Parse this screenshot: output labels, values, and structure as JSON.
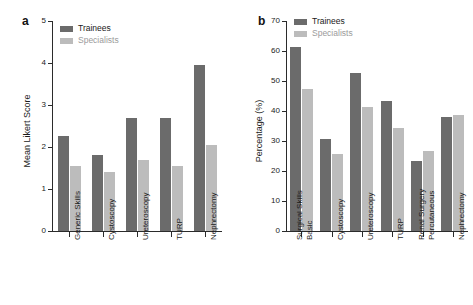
{
  "figure": {
    "background": "#ffffff",
    "colors": {
      "trainees": "#6b6b6b",
      "specialists": "#bcbcbc",
      "axis": "#2b2b2b",
      "text": "#1a1a1a"
    }
  },
  "panel_a": {
    "letter": "a",
    "legend": [
      {
        "label": "Trainees",
        "color": "#6b6b6b"
      },
      {
        "label": "Specialists",
        "color": "#bcbcbc"
      }
    ]
  },
  "panel_b": {
    "letter": "b",
    "legend": [
      {
        "label": "Trainees",
        "color": "#6b6b6b"
      },
      {
        "label": "Specialists",
        "color": "#bcbcbc"
      }
    ]
  },
  "chart_data": [
    {
      "panel": "a",
      "type": "bar",
      "title": "",
      "xlabel": "",
      "ylabel": "Mean Likert Score",
      "ylim": [
        0,
        5
      ],
      "yticks": [
        0,
        1,
        2,
        3,
        4,
        5
      ],
      "ytick_labels": [
        "0",
        "1",
        "2",
        "3",
        "4",
        "5"
      ],
      "grid": false,
      "legend_position": "top-left",
      "categories": [
        "Generic Skills",
        "Cystoscopy",
        "Ureteroscopy",
        "TURP",
        "Nephrectomy"
      ],
      "series": [
        {
          "name": "Trainees",
          "color": "#6b6b6b",
          "values": [
            2.27,
            1.81,
            2.68,
            2.68,
            3.95
          ]
        },
        {
          "name": "Specialists",
          "color": "#bcbcbc",
          "values": [
            1.55,
            1.4,
            1.7,
            1.55,
            2.05
          ]
        }
      ]
    },
    {
      "panel": "b",
      "type": "bar",
      "title": "",
      "xlabel": "",
      "ylabel": "Percentage (%)",
      "ylim": [
        0,
        70
      ],
      "yticks": [
        0,
        10,
        20,
        30,
        40,
        50,
        60,
        70
      ],
      "ytick_labels": [
        "0",
        "10",
        "20",
        "30",
        "40",
        "50",
        "60",
        "70"
      ],
      "grid": false,
      "legend_position": "top-left",
      "categories": [
        "Basic\nSurgical Skills",
        "Cystoscopy",
        "Ureteroscopy",
        "TURP",
        "Percutaneous\nRenal Surgery",
        "Nephrectomy"
      ],
      "series": [
        {
          "name": "Trainees",
          "color": "#6b6b6b",
          "values": [
            61.5,
            30.8,
            52.7,
            43.5,
            23.4,
            38.1
          ]
        },
        {
          "name": "Specialists",
          "color": "#bcbcbc",
          "values": [
            47.3,
            25.6,
            41.3,
            34.5,
            26.8,
            38.8
          ]
        }
      ]
    }
  ]
}
